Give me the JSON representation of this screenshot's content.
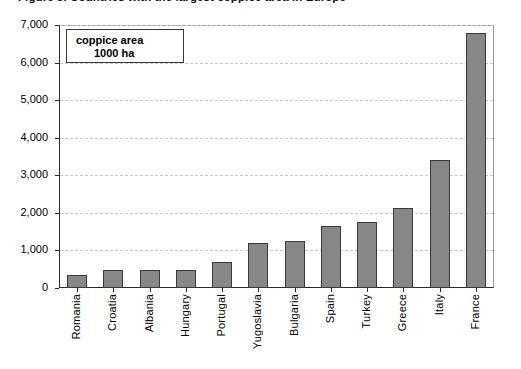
{
  "figure": {
    "title_clipped": "Figure 3.  Countries with the largest coppice area in Europe"
  },
  "legend": {
    "line1": "coppice area",
    "line2": "1000 ha"
  },
  "axes": {
    "y_ticks": [
      "0",
      "1,000",
      "2,000",
      "3,000",
      "4,000",
      "5,000",
      "6,000",
      "7,000"
    ],
    "y_min": 0,
    "y_max": 7000,
    "y_step": 1000
  },
  "chart_data": {
    "type": "bar",
    "title": "Countries with the largest coppice area in Europe",
    "xlabel": "",
    "ylabel": "coppice area 1000 ha",
    "ylim": [
      0,
      7000
    ],
    "ytick_step": 1000,
    "grid": true,
    "legend_position": "inside-top-left",
    "bar_color": "#878787",
    "bar_border_color": "#3a3a3a",
    "categories": [
      "Romania",
      "Croatia",
      "Albania",
      "Hungary",
      "Portugal",
      "Yugoslavia",
      "Bulgaria",
      "Spain",
      "Turkey",
      "Greece",
      "Italy",
      "France"
    ],
    "values": [
      350,
      470,
      480,
      490,
      680,
      1200,
      1260,
      1650,
      1760,
      2130,
      3410,
      6800
    ],
    "unit": "1000 ha"
  }
}
